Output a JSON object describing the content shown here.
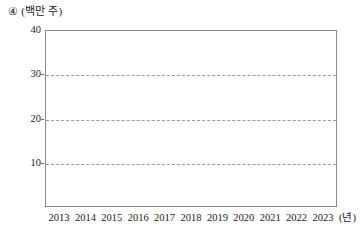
{
  "header": {
    "item_number": "④",
    "unit_label": "(백만 주)"
  },
  "axes": {
    "x_unit": "(년)"
  },
  "chart_data": {
    "type": "line",
    "title": "",
    "subtitle": "",
    "xlabel": "(년)",
    "ylabel": "(백만 주)",
    "categories": [
      "2013",
      "2014",
      "2015",
      "2016",
      "2017",
      "2018",
      "2019",
      "2020",
      "2021",
      "2022",
      "2023"
    ],
    "values": [
      10,
      12,
      19,
      22,
      31.5,
      31.5,
      28,
      28,
      27,
      28.5,
      31.5
    ],
    "series": [
      {
        "name": "",
        "values": [
          10,
          12,
          19,
          22,
          31.5,
          31.5,
          28,
          28,
          27,
          28.5,
          31.5
        ]
      }
    ],
    "ylim": [
      0,
      40
    ],
    "yticks": [
      10,
      20,
      30,
      40
    ],
    "ytick_labels": [
      "10",
      "20",
      "30",
      "40"
    ],
    "xlim": [
      "2013",
      "2023"
    ],
    "xticks": [
      "2013",
      "2014",
      "2015",
      "2016",
      "2017",
      "2018",
      "2019",
      "2020",
      "2021",
      "2022",
      "2023"
    ],
    "grid": true,
    "grid_axis": "y",
    "grid_style": "dashed",
    "legend": false,
    "legend_position": "none",
    "marker": "diamond",
    "line_color": "#6a6a6a",
    "marker_color": "#5e5e5e",
    "annotations": []
  }
}
